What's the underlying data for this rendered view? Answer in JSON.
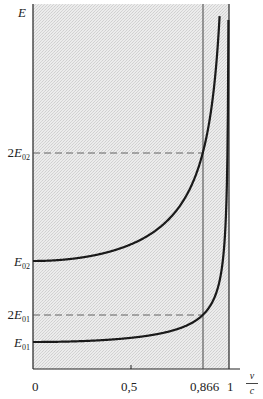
{
  "chart_data": {
    "type": "line",
    "title": "",
    "xlabel": "v/c",
    "ylabel": "E",
    "xlim": [
      0,
      1
    ],
    "grid": false,
    "background": "stippled grey fill",
    "series": [
      {
        "name": "E = E01 / sqrt(1 - (v/c)^2)",
        "rest_energy_label": "E01",
        "rest_energy_relative": 1
      },
      {
        "name": "E = E02 / sqrt(1 - (v/c)^2)",
        "rest_energy_label": "E02",
        "rest_energy_relative": 4
      }
    ],
    "x_ticks": [
      {
        "value": 0,
        "label": "0"
      },
      {
        "value": 0.5,
        "label": "0,5"
      },
      {
        "value": 0.866,
        "label": "0,866"
      },
      {
        "value": 1,
        "label": "1"
      }
    ],
    "y_ticks": [
      {
        "label": "E01",
        "relative": 1
      },
      {
        "label": "2E01",
        "relative": 2
      },
      {
        "label": "E02",
        "relative": 4
      },
      {
        "label": "2E02",
        "relative": 8
      }
    ],
    "annotations": [
      {
        "type": "vertical-line",
        "x": 0.866,
        "note": "energy doubles at v/c = 0,866"
      },
      {
        "type": "vertical-asymptote",
        "x": 1
      },
      {
        "type": "dashed-horizontal",
        "label": "2E01"
      },
      {
        "type": "dashed-horizontal",
        "label": "2E02"
      }
    ]
  },
  "labels": {
    "y_axis": "E",
    "x_axis_num": "v",
    "x_axis_den": "c",
    "tick_0": "0",
    "tick_05": "0,5",
    "tick_0866": "0,866",
    "tick_1": "1",
    "E_sym": "E",
    "two": "2",
    "sub01": "01",
    "sub02": "02"
  },
  "colors": {
    "curve": "#1a1a1a",
    "axis": "#222222",
    "fill": "#e4e4e4",
    "dash": "#555555"
  }
}
